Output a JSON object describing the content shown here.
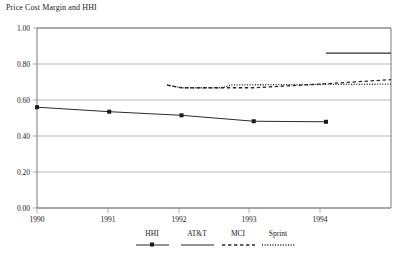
{
  "chart_data": {
    "type": "line",
    "title": "Price Cost Margin and HHI",
    "xlabel": "",
    "ylabel": "",
    "x": [
      1990,
      1991,
      1992,
      1993,
      1994
    ],
    "categories": [
      "1990",
      "1991",
      "1992",
      "1993",
      "1994"
    ],
    "xlim": [
      1990,
      1994.9
    ],
    "ylim": [
      0.0,
      1.0
    ],
    "ytick_labels": [
      "0.00",
      "0.20",
      "0.40",
      "0.60",
      "0.80",
      "1.00"
    ],
    "ytick_values": [
      0.0,
      0.2,
      0.4,
      0.6,
      0.8,
      1.0
    ],
    "xtick_labels": [
      "1990",
      "1991",
      "1992",
      "1993",
      "1994"
    ],
    "grid": true,
    "grid_axis": "y",
    "legend_position": "bottom",
    "series": [
      {
        "name": "HHI",
        "style": "solid-marker",
        "marker": "square",
        "x": [
          1990,
          1991,
          1992,
          1993,
          1994
        ],
        "values": [
          0.56,
          0.535,
          0.515,
          0.482,
          0.479
        ]
      },
      {
        "name": "AT&T",
        "style": "solid",
        "marker": "none",
        "x": [
          1994.0,
          1994.9
        ],
        "values": [
          0.86,
          0.86
        ]
      },
      {
        "name": "MCI",
        "style": "dashed",
        "marker": "none",
        "x": [
          1991.8,
          1992.0,
          1993.0,
          1993.9,
          1994.9
        ],
        "values": [
          0.683,
          0.668,
          0.668,
          0.688,
          0.713
        ]
      },
      {
        "name": "Sprint",
        "style": "dotted",
        "marker": "none",
        "x": [
          1991.8,
          1992.0,
          1992.55,
          1992.7,
          1994.9
        ],
        "values": [
          0.683,
          0.668,
          0.668,
          0.684,
          0.688
        ]
      }
    ]
  },
  "legend": {
    "entries": [
      {
        "label": "HHI",
        "style": "solid-marker"
      },
      {
        "label": "AT&T",
        "style": "solid"
      },
      {
        "label": "MCI",
        "style": "dashed"
      },
      {
        "label": "Sprint",
        "style": "dotted"
      }
    ]
  },
  "colors": {
    "line": "#2b2b2b",
    "grid": "#9a9a9a",
    "frame": "#6e6e6e",
    "text": "#1a1a1a",
    "background": "#ffffff"
  }
}
